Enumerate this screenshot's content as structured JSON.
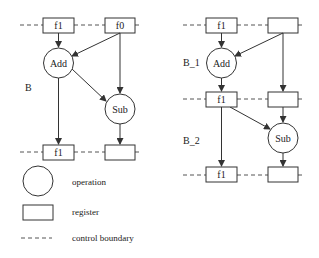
{
  "left_diagram": {
    "label": "B",
    "top_registers": [
      "f1",
      "f0"
    ],
    "operations": [
      "Add",
      "Sub"
    ],
    "bottom_registers": [
      "f1",
      ""
    ]
  },
  "right_diagram": {
    "labels": [
      "B_1",
      "B_2"
    ],
    "top_registers": [
      "f1",
      ""
    ],
    "operations": [
      "Add",
      "Sub"
    ],
    "middle_registers": [
      "f1",
      ""
    ],
    "bottom_registers": [
      "f1",
      ""
    ]
  },
  "legend": {
    "items": [
      {
        "symbol": "circle",
        "label": "operation"
      },
      {
        "symbol": "rectangle",
        "label": "register"
      },
      {
        "symbol": "dashed-line",
        "label": "control boundary"
      }
    ]
  },
  "colors": {
    "stroke": "#333333",
    "background": "#ffffff"
  }
}
